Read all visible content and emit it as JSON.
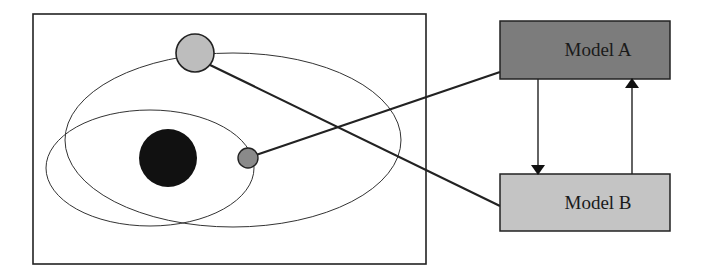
{
  "diagram": {
    "orbit_panel": {
      "frame": {
        "x": 33,
        "y": 14,
        "w": 393,
        "h": 250
      },
      "orbits": [
        {
          "name": "outer-orbit",
          "cx": 233,
          "cy": 140,
          "rx": 168,
          "ry": 87
        },
        {
          "name": "inner-orbit",
          "cx": 150,
          "cy": 168,
          "rx": 104,
          "ry": 58
        }
      ],
      "bodies": [
        {
          "name": "central-body",
          "cx": 168,
          "cy": 158,
          "r": 29,
          "fill": "#111111"
        },
        {
          "name": "large-satellite",
          "cx": 195,
          "cy": 53,
          "r": 19,
          "fill": "#bdbdbd"
        },
        {
          "name": "small-satellite",
          "cx": 248,
          "cy": 158,
          "r": 10,
          "fill": "#8a8a8a"
        }
      ]
    },
    "models": [
      {
        "id": "model_a",
        "label": "Model A",
        "x": 500,
        "y": 21,
        "w": 170,
        "h": 58,
        "fill": "#7c7c7c"
      },
      {
        "id": "model_b",
        "label": "Model B",
        "x": 500,
        "y": 174,
        "w": 170,
        "h": 57,
        "fill": "#c4c4c4"
      }
    ],
    "connectors": [
      {
        "from": "small-satellite",
        "to": "Model A"
      },
      {
        "from": "large-satellite",
        "to": "Model B"
      }
    ],
    "arrows": [
      {
        "from": "Model A",
        "to": "Model B",
        "direction": "down"
      },
      {
        "from": "Model B",
        "to": "Model A",
        "direction": "up"
      }
    ]
  }
}
